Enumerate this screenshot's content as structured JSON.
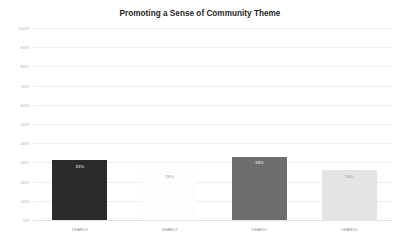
{
  "chart_data": {
    "type": "bar",
    "title": "Promoting a Sense of Community Theme",
    "xlabel": "",
    "ylabel": "",
    "categories": [
      "DFAR13",
      "DFAR12",
      "DFAR11",
      "DFAR10"
    ],
    "values": [
      31,
      26,
      33,
      26
    ],
    "value_labels": [
      "31%",
      "26%",
      "33%",
      "26%"
    ],
    "bar_colors": [
      "#2b2b2b",
      "#fdfdfd",
      "#6e6e6e",
      "#e4e4e4"
    ],
    "value_label_colors": [
      "#ffffff",
      "#9a9a9a",
      "#ffffff",
      "#9a9a9a"
    ],
    "ylim": [
      0,
      100
    ],
    "ytick_labels": [
      "100%",
      "90%",
      "80%",
      "70%",
      "60%",
      "50%",
      "40%",
      "30%",
      "20%",
      "10%",
      "0%"
    ],
    "ytick_values": [
      100,
      90,
      80,
      70,
      60,
      50,
      40,
      30,
      20,
      10,
      0
    ],
    "grid": true,
    "legend": "none",
    "background": "#ffffff",
    "grid_color": "#ededed",
    "title_color": "#1f1f1f",
    "tick_color": "#b0b0b0"
  }
}
